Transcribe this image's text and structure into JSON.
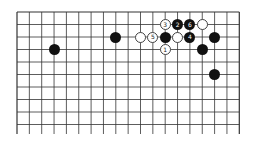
{
  "board": {
    "columns": 19,
    "visible_rows": 10,
    "origin_x": 17,
    "origin_y": 12,
    "spacing_x": 12.35,
    "spacing_y": 12.5,
    "line_color": "#333333"
  },
  "stones": [
    {
      "color": "black",
      "col": 3,
      "row": 3,
      "label": ""
    },
    {
      "color": "black",
      "col": 8,
      "row": 2,
      "label": ""
    },
    {
      "color": "white",
      "col": 10,
      "row": 2,
      "label": ""
    },
    {
      "color": "white",
      "col": 11,
      "row": 2,
      "label": "5"
    },
    {
      "color": "black",
      "col": 12,
      "row": 2,
      "label": ""
    },
    {
      "color": "white",
      "col": 12,
      "row": 1,
      "label": "3"
    },
    {
      "color": "black",
      "col": 13,
      "row": 1,
      "label": "2"
    },
    {
      "color": "black",
      "col": 14,
      "row": 1,
      "label": "6"
    },
    {
      "color": "white",
      "col": 15,
      "row": 1,
      "label": ""
    },
    {
      "color": "white",
      "col": 13,
      "row": 2,
      "label": ""
    },
    {
      "color": "black",
      "col": 14,
      "row": 2,
      "label": "4"
    },
    {
      "color": "black",
      "col": 16,
      "row": 2,
      "label": ""
    },
    {
      "color": "white",
      "col": 12,
      "row": 3,
      "label": "1"
    },
    {
      "color": "black",
      "col": 15,
      "row": 3,
      "label": ""
    },
    {
      "color": "black",
      "col": 16,
      "row": 5,
      "label": ""
    }
  ]
}
